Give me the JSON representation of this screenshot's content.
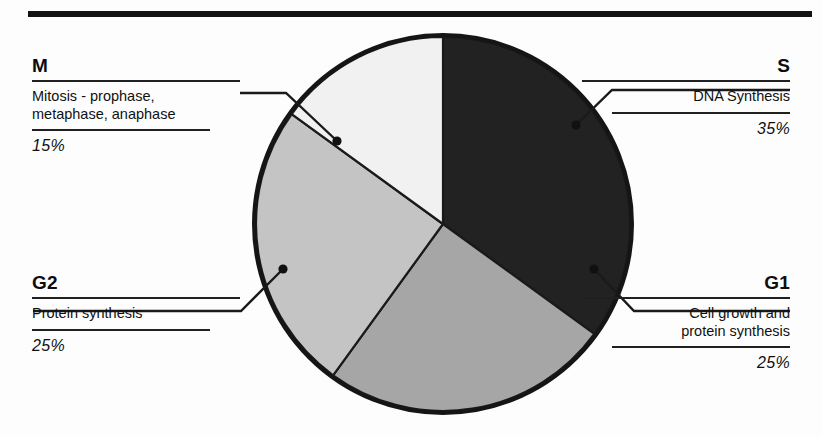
{
  "figure": {
    "background_color": "#fdfdfd",
    "rule_color": "#131313"
  },
  "chart_data": {
    "type": "pie",
    "title": "",
    "xlabel": "",
    "ylabel": "",
    "legend_position": "callout-labels",
    "grid": false,
    "start_angle_deg": 0,
    "direction": "clockwise",
    "total": 100,
    "categories": [
      "S",
      "G1",
      "G2",
      "M"
    ],
    "values": [
      35,
      25,
      25,
      15
    ],
    "labels": [
      "35%",
      "25%",
      "25%",
      "15%"
    ],
    "colors": [
      "#222222",
      "#a6a6a6",
      "#c4c4c4",
      "#f1f1f1"
    ],
    "slices": [
      {
        "key": "S",
        "description": "DNA Synthesis",
        "percent": 35,
        "percent_label": "35%",
        "color": "#222222",
        "start_deg": 0,
        "end_deg": 126
      },
      {
        "key": "G1",
        "description": "Cell growth and\nprotein synthesis",
        "percent": 25,
        "percent_label": "25%",
        "color": "#a6a6a6",
        "start_deg": 126,
        "end_deg": 216
      },
      {
        "key": "G2",
        "description": "Protein synthesis",
        "percent": 25,
        "percent_label": "25%",
        "color": "#c4c4c4",
        "start_deg": 216,
        "end_deg": 306
      },
      {
        "key": "M",
        "description": "Mitosis - prophase,\nmetaphase, anaphase",
        "percent": 15,
        "percent_label": "15%",
        "color": "#f1f1f1",
        "start_deg": 306,
        "end_deg": 360
      }
    ]
  },
  "callouts": {
    "m": {
      "key": "M",
      "description": "Mitosis - prophase,\nmetaphase, anaphase",
      "percent_label": "15%"
    },
    "s": {
      "key": "S",
      "description": "DNA Synthesis",
      "percent_label": "35%"
    },
    "g2": {
      "key": "G2",
      "description": "Protein synthesis",
      "percent_label": "25%"
    },
    "g1": {
      "key": "G1",
      "description": "Cell growth and\nprotein synthesis",
      "percent_label": "25%"
    }
  }
}
